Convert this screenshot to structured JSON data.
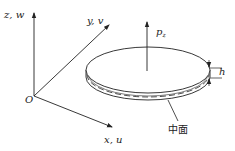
{
  "diagram": {
    "type": "thin plate coordinate system",
    "axes": {
      "z": {
        "label": "z, w"
      },
      "y": {
        "label": "y, v"
      },
      "x": {
        "label": "x, u"
      },
      "origin": {
        "label": "O"
      }
    },
    "load": {
      "symbol": "p",
      "subscript": "z"
    },
    "thickness": {
      "label": "h"
    },
    "mid_surface": {
      "label": "中面"
    },
    "colors": {
      "stroke": "#222222",
      "background": "#ffffff"
    }
  }
}
